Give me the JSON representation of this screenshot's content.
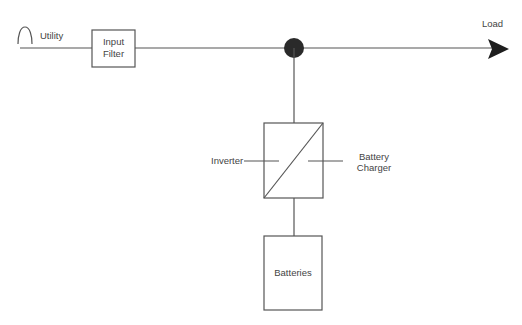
{
  "diagram": {
    "type": "block-diagram",
    "title": "",
    "colors": {
      "stroke": "#555555",
      "node": "#2a2a2a",
      "text": "#444444"
    },
    "source": {
      "icon": "sine-wave-icon",
      "label": "Utility"
    },
    "nodes": {
      "input_filter": {
        "line1": "Input",
        "line2": "Filter"
      },
      "converter": {
        "left_label": "Inverter",
        "right_line1": "Battery",
        "right_line2": "Charger"
      },
      "batteries": {
        "label": "Batteries"
      },
      "output": {
        "label": "Load"
      }
    },
    "edges": [
      [
        "Utility",
        "Input Filter"
      ],
      [
        "Input Filter",
        "Junction"
      ],
      [
        "Junction",
        "Load"
      ],
      [
        "Junction",
        "Inverter/Battery Charger"
      ],
      [
        "Inverter/Battery Charger",
        "Batteries"
      ]
    ]
  }
}
